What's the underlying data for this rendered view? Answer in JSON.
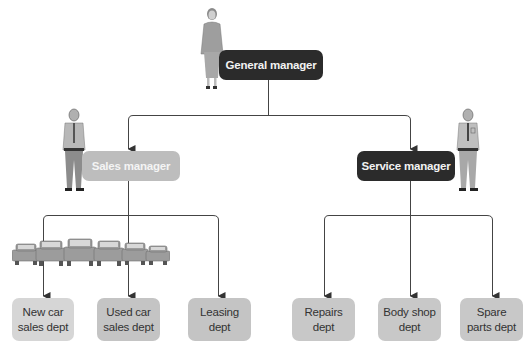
{
  "colors": {
    "line": "#444444",
    "dark_box": "#2b2b2b",
    "sales_box": "#bdbdbd",
    "dept_light": "#d6d6d6",
    "dept_mid": "#c4c4c4",
    "figure": "#9a9a9a"
  },
  "chart": {
    "root": {
      "label": "General manager",
      "icon": "businesswoman-figure"
    },
    "managers": [
      {
        "label": "Sales manager",
        "icon": "salesman-figure",
        "departments": [
          {
            "line1": "New car",
            "line2": "sales dept"
          },
          {
            "line1": "Used car",
            "line2": "sales dept"
          },
          {
            "line1": "Leasing",
            "line2": "dept"
          }
        ],
        "decoration": "row-of-cars"
      },
      {
        "label": "Service manager",
        "icon": "mechanic-figure",
        "departments": [
          {
            "line1": "Repairs",
            "line2": "dept"
          },
          {
            "line1": "Body shop",
            "line2": "dept"
          },
          {
            "line1": "Spare",
            "line2": "parts dept"
          }
        ]
      }
    ]
  }
}
